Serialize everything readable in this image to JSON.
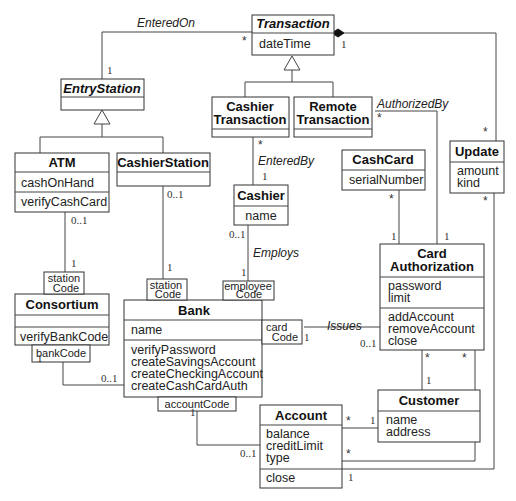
{
  "classes": {
    "transaction": {
      "name": "Transaction",
      "attrs": [
        "dateTime"
      ]
    },
    "entry_station": {
      "name": "EntryStation"
    },
    "cashier_transaction": {
      "name_line1": "Cashier",
      "name_line2": "Transaction"
    },
    "remote_transaction": {
      "name_line1": "Remote",
      "name_line2": "Transaction"
    },
    "atm": {
      "name": "ATM",
      "attrs": [
        "cashOnHand"
      ],
      "ops": [
        "verifyCashCard"
      ]
    },
    "cashier_station": {
      "name": "CashierStation"
    },
    "cashier": {
      "name": "Cashier",
      "attrs": [
        "name"
      ]
    },
    "cash_card": {
      "name": "CashCard",
      "attrs": [
        "serialNumber"
      ]
    },
    "update": {
      "name": "Update",
      "attrs": [
        "amount",
        "kind"
      ]
    },
    "card_authorization": {
      "name_line1": "Card",
      "name_line2": "Authorization",
      "attrs": [
        "password",
        "limit"
      ],
      "ops": [
        "addAccount",
        "removeAccount",
        "close"
      ]
    },
    "consortium": {
      "name": "Consortium",
      "ops": [
        "verifyBankCode"
      ]
    },
    "bank": {
      "name": "Bank",
      "attrs": [
        "name"
      ],
      "ops": [
        "verifyPassword",
        "createSavingsAccount",
        "createCheckingAccount",
        "createCashCardAuth"
      ]
    },
    "customer": {
      "name": "Customer",
      "attrs": [
        "name",
        "address"
      ]
    },
    "account": {
      "name": "Account",
      "attrs": [
        "balance",
        "creditLimit",
        "type"
      ],
      "ops": [
        "close"
      ]
    }
  },
  "qualifiers": {
    "consortium_station": {
      "line1": "station",
      "line2": "Code"
    },
    "bank_station": {
      "line1": "station",
      "line2": "Code"
    },
    "bank_employee": {
      "line1": "employee",
      "line2": "Code"
    },
    "bank_card": {
      "line1": "card",
      "line2": "Code"
    },
    "consortium_bank": {
      "label": "bankCode"
    },
    "bank_account": {
      "label": "accountCode"
    }
  },
  "associations": {
    "entered_on": "EnteredOn",
    "authorized_by": "AuthorizedBy",
    "entered_by": "EnteredBy",
    "employs": "Employs",
    "issues": "Issues"
  },
  "multiplicities": {
    "one": "1",
    "many": "*",
    "zero_one": "0..1"
  }
}
